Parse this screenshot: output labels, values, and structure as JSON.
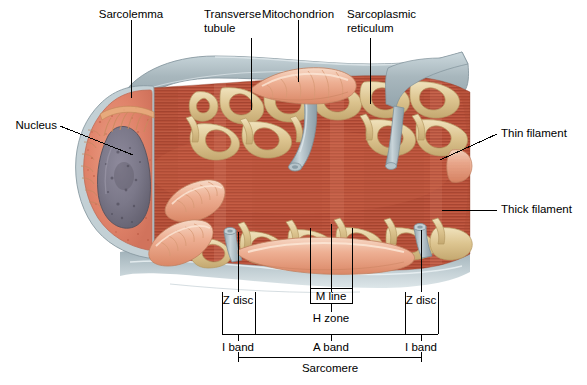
{
  "figure": {
    "background_color": "#ffffff",
    "width": 587,
    "height": 385
  },
  "palette": {
    "sarcolemma": "#a8b7bd",
    "sarcolemma_light": "#c6d2d6",
    "sarcoplasm": "#e0836a",
    "sarcoplasm_light": "#e79a80",
    "nucleus": "#7d7a8c",
    "nucleus_dark": "#5d5a6d",
    "mitochondrion": "#e8a287",
    "mitochondrion_light": "#f3cdb8",
    "sarcoplasmic_reticulum": "#d9c08a",
    "sr_light": "#ecdcb4",
    "myofibril": "#b8503a",
    "myofibril_dark": "#9c4030",
    "myofibril_light": "#c86a4e",
    "tubule": "#9fb0b8",
    "leader_line": "#000000",
    "text": "#000000"
  },
  "labels": {
    "sarcolemma": "Sarcolemma",
    "transverse_tubule_line1": "Transverse",
    "transverse_tubule_line2": "tubule",
    "mitochondrion": "Mitochondrion",
    "sarcoplasmic_reticulum_line1": "Sarcoplasmic",
    "sarcoplasmic_reticulum_line2": "reticulum",
    "nucleus": "Nucleus",
    "thin_filament": "Thin filament",
    "thick_filament": "Thick filament",
    "z_disc_left": "Z disc",
    "z_disc_right": "Z disc",
    "m_line": "M line",
    "h_zone": "H zone",
    "i_band_left": "I band",
    "a_band": "A band",
    "i_band_right": "I band",
    "sarcomere": "Sarcomere"
  }
}
